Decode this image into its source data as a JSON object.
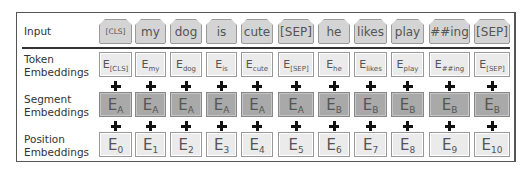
{
  "rows": {
    "input": {
      "label": "Input"
    },
    "token": {
      "label_line1": "Token",
      "label_line2": "Embeddings"
    },
    "segment": {
      "label_line1": "Segment",
      "label_line2": "Embeddings"
    },
    "position": {
      "label_line1": "Position",
      "label_line2": "Embeddings"
    }
  },
  "tokens": [
    {
      "input": "[CLS]",
      "tok_sub": "[CLS]",
      "seg_sub": "A",
      "pos_sub": "0"
    },
    {
      "input": "my",
      "tok_sub": "my",
      "seg_sub": "A",
      "pos_sub": "1"
    },
    {
      "input": "dog",
      "tok_sub": "dog",
      "seg_sub": "A",
      "pos_sub": "2"
    },
    {
      "input": "is",
      "tok_sub": "is",
      "seg_sub": "A",
      "pos_sub": "3"
    },
    {
      "input": "cute",
      "tok_sub": "cute",
      "seg_sub": "A",
      "pos_sub": "4"
    },
    {
      "input": "[SEP]",
      "tok_sub": "[SEP]",
      "seg_sub": "A",
      "pos_sub": "5"
    },
    {
      "input": "he",
      "tok_sub": "he",
      "seg_sub": "B",
      "pos_sub": "6"
    },
    {
      "input": "likes",
      "tok_sub": "likes",
      "seg_sub": "B",
      "pos_sub": "7"
    },
    {
      "input": "play",
      "tok_sub": "play",
      "seg_sub": "B",
      "pos_sub": "8"
    },
    {
      "input": "##ing",
      "tok_sub": "##ing",
      "seg_sub": "B",
      "pos_sub": "9"
    },
    {
      "input": "[SEP]",
      "tok_sub": "[SEP]",
      "seg_sub": "B",
      "pos_sub": "10"
    }
  ],
  "embedding_symbol": "E",
  "colors": {
    "input_fill": "#d4d4d4",
    "token_fill": "#ebebeb",
    "segment_fill": "#a9a9a9",
    "position_fill": "#ebebeb",
    "frame": "#555555"
  }
}
